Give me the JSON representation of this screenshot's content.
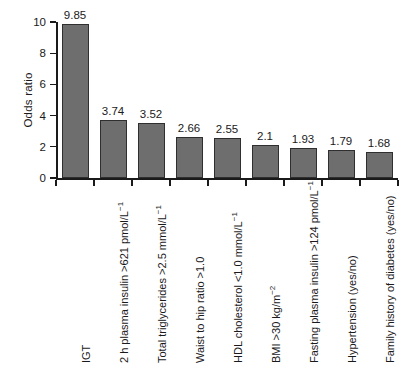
{
  "chart_data": {
    "type": "bar",
    "title": "",
    "subtitle": "",
    "xlabel": "",
    "ylabel": "Odds ratio",
    "ylim": [
      0,
      10
    ],
    "yticks": [
      0,
      2,
      4,
      6,
      8,
      10
    ],
    "grid": false,
    "legend": "none",
    "orientation": "vertical",
    "bar_color": "#6e6e6e",
    "bar_edge_color": "#2f2f2f",
    "background_color": "#ffffff",
    "categories": [
      "IGT",
      "2 h plasma insulin >621 pmol/L⁻¹",
      "Total triglycerides >2.5 mmol/L⁻¹",
      "Waist to hip ratio >1.0",
      "HDL cholesterol <1.0 mmol/L⁻¹",
      "BMI >30 kg/m⁻²",
      "Fasting plasma insulin >124 pmol/L⁻¹",
      "Hypertension (yes/no)",
      "Family history of diabetes (yes/no)"
    ],
    "values": [
      9.85,
      3.74,
      3.52,
      2.66,
      2.55,
      2.1,
      1.93,
      1.79,
      1.68
    ],
    "value_labels": [
      "9.85",
      "3.74",
      "3.52",
      "2.66",
      "2.55",
      "2.1",
      "1.93",
      "1.79",
      "1.68"
    ],
    "ytick_labels": [
      "0",
      "2",
      "4",
      "6",
      "8",
      "10"
    ]
  }
}
